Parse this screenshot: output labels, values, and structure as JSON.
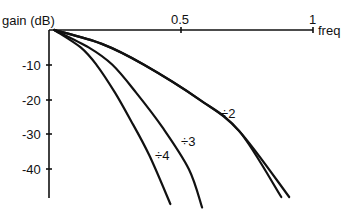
{
  "chart_data": {
    "type": "line",
    "title": "",
    "xlabel": "freq",
    "ylabel": "gain (dB)",
    "xlim": [
      0,
      1
    ],
    "ylim": [
      -48,
      0
    ],
    "grid": false,
    "legend": "inline labels",
    "x_ticks": [
      {
        "value": 0.5,
        "label": "0.5"
      },
      {
        "value": 1,
        "label": "1"
      }
    ],
    "y_ticks": [
      {
        "value": -10,
        "label": "-10"
      },
      {
        "value": -20,
        "label": "-20"
      },
      {
        "value": -30,
        "label": "-30"
      },
      {
        "value": -40,
        "label": "-40"
      }
    ],
    "series": [
      {
        "name": "÷2",
        "points": [
          [
            0.02,
            0
          ],
          [
            0.2,
            -4
          ],
          [
            0.36,
            -10
          ],
          [
            0.57,
            -20
          ],
          [
            0.72,
            -29
          ],
          [
            0.88,
            -48
          ]
        ]
      },
      {
        "name": "÷2 (alt)",
        "points": [
          [
            0.02,
            0
          ],
          [
            0.2,
            -4
          ],
          [
            0.36,
            -10
          ],
          [
            0.57,
            -20
          ],
          [
            0.72,
            -29
          ],
          [
            0.91,
            -48
          ]
        ]
      },
      {
        "name": "÷3",
        "points": [
          [
            0.02,
            0
          ],
          [
            0.15,
            -5
          ],
          [
            0.24,
            -10
          ],
          [
            0.33,
            -18
          ],
          [
            0.43,
            -28
          ],
          [
            0.53,
            -40
          ],
          [
            0.58,
            -51
          ]
        ]
      },
      {
        "name": "÷4",
        "points": [
          [
            0.02,
            0
          ],
          [
            0.12,
            -5
          ],
          [
            0.18,
            -10
          ],
          [
            0.25,
            -18
          ],
          [
            0.31,
            -26
          ],
          [
            0.38,
            -36
          ],
          [
            0.46,
            -50
          ]
        ]
      }
    ],
    "annotations": [
      {
        "text": "÷2",
        "x": 0.73,
        "y": -27
      },
      {
        "text": "÷3",
        "x": 0.51,
        "y": -31
      },
      {
        "text": "÷4",
        "x": 0.42,
        "y": -35
      }
    ]
  },
  "labels": {
    "ylabel": "gain (dB)",
    "xlabel": "freq",
    "xtick_05": "0.5",
    "xtick_1": "1",
    "ytick_10": "-10",
    "ytick_20": "-20",
    "ytick_30": "-30",
    "ytick_40": "-40",
    "ann_2": "÷2",
    "ann_3": "÷3",
    "ann_4": "÷4"
  }
}
